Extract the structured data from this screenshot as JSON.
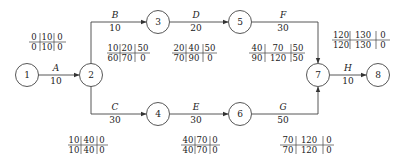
{
  "nodes": [
    {
      "id": "1",
      "x": 27,
      "y": 75
    },
    {
      "id": "2",
      "x": 91,
      "y": 75
    },
    {
      "id": "3",
      "x": 158,
      "y": 22
    },
    {
      "id": "4",
      "x": 158,
      "y": 114
    },
    {
      "id": "5",
      "x": 240,
      "y": 22
    },
    {
      "id": "6",
      "x": 240,
      "y": 114
    },
    {
      "id": "7",
      "x": 318,
      "y": 75
    },
    {
      "id": "8",
      "x": 378,
      "y": 75
    }
  ],
  "activities": [
    {
      "name": "A",
      "duration": "10"
    },
    {
      "name": "B",
      "duration": "10"
    },
    {
      "name": "C",
      "duration": "30"
    },
    {
      "name": "D",
      "duration": "20"
    },
    {
      "name": "E",
      "duration": "30"
    },
    {
      "name": "F",
      "duration": "30"
    },
    {
      "name": "G",
      "duration": "50"
    },
    {
      "name": "H",
      "duration": "10"
    }
  ],
  "tables": [
    {
      "activity": "A",
      "top": [
        "0",
        "10",
        "0"
      ],
      "bottom": [
        "0",
        "10",
        "0"
      ]
    },
    {
      "activity": "B",
      "top": [
        "10",
        "20",
        "50"
      ],
      "bottom": [
        "60",
        "70",
        "0"
      ]
    },
    {
      "activity": "C",
      "top": [
        "10",
        "40",
        "0"
      ],
      "bottom": [
        "10",
        "40",
        "0"
      ]
    },
    {
      "activity": "D",
      "top": [
        "20",
        "40",
        "50"
      ],
      "bottom": [
        "70",
        "90",
        "0"
      ]
    },
    {
      "activity": "E",
      "top": [
        "40",
        "70",
        "0"
      ],
      "bottom": [
        "40",
        "70",
        "0"
      ]
    },
    {
      "activity": "F",
      "top": [
        "40",
        "70",
        "50"
      ],
      "bottom": [
        "90",
        "120",
        "50"
      ]
    },
    {
      "activity": "G",
      "top": [
        "70",
        "120",
        "0"
      ],
      "bottom": [
        "70",
        "120",
        "0"
      ]
    },
    {
      "activity": "H",
      "top": [
        "120",
        "130",
        "0"
      ],
      "bottom": [
        "120",
        "130",
        "0"
      ]
    }
  ]
}
